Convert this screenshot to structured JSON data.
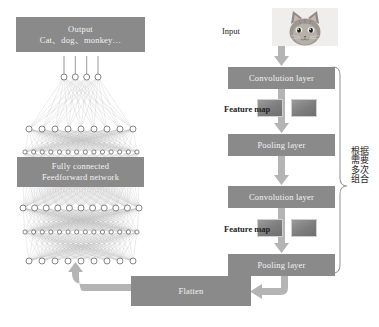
{
  "diagram": {
    "colors": {
      "box_fill": "#8a8a8a",
      "arrow_fill": "#b4b4b4",
      "box_text": "#f2f2f2",
      "label_text": "#232323",
      "node_fill": "#ffffff",
      "node_stroke": "#555555",
      "edge_stroke": "#999999",
      "bracket_stroke": "#9a9a9a"
    }
  },
  "left_panel": {
    "output_box": {
      "line1": "Output",
      "line2": "Cat、dog、monkey…"
    },
    "fc_box": {
      "line1": "Fully connected",
      "line2": "Feedforward network"
    },
    "network": {
      "layer_node_counts": [
        4,
        9,
        14,
        11,
        14,
        9
      ]
    }
  },
  "right_panel": {
    "input_label": "Input",
    "input_image_alt": "cat-photo",
    "blocks": [
      {
        "label": "Convolution layer"
      },
      {
        "label": "Pooling layer"
      },
      {
        "label": "Convolution layer"
      },
      {
        "label": "Pooling layer"
      }
    ],
    "feature_maps": [
      {
        "label": "Feature map",
        "thumbnails": 2
      },
      {
        "label": "Feature map",
        "thumbnails": 2
      }
    ],
    "bracket_note": {
      "col1": [
        "根",
        "需",
        "多",
        "组"
      ],
      "col2": [
        "据",
        "要",
        "次",
        "合"
      ],
      "full_text": "根据需要多次组合"
    }
  },
  "bottom": {
    "flatten_label": "Flatten"
  }
}
